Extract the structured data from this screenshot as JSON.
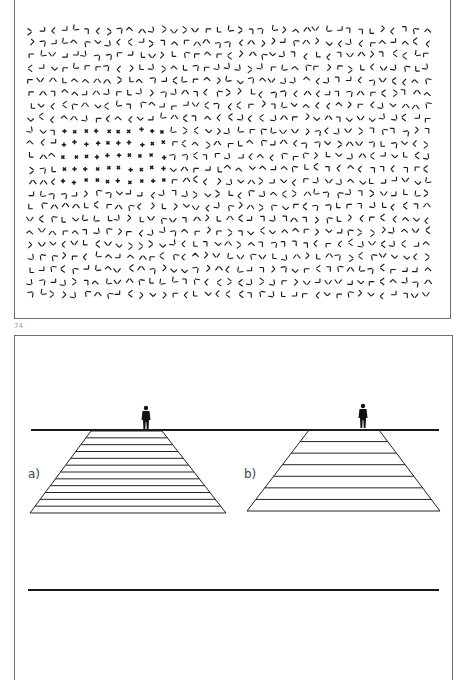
{
  "figure_top": {
    "description": "Texture segregation field: randomly oriented L/T-like line-pair elements with an embedded region of '+' and 'x' crosses",
    "rows": 22,
    "cols": 37,
    "cross_region": {
      "row_start": 8,
      "row_end": 12,
      "col_start": 3,
      "col_end": 12
    }
  },
  "page_number": "74",
  "figure_bottom": {
    "panel_a": {
      "label": "a)",
      "stripes": 12
    },
    "panel_b": {
      "label": "b)",
      "stripes": 7
    },
    "figure_icon": "standing-person"
  },
  "colors": {
    "ink": "#1a1a1a",
    "frame": "#6e6e6e",
    "caption": "#9a9a9a"
  }
}
